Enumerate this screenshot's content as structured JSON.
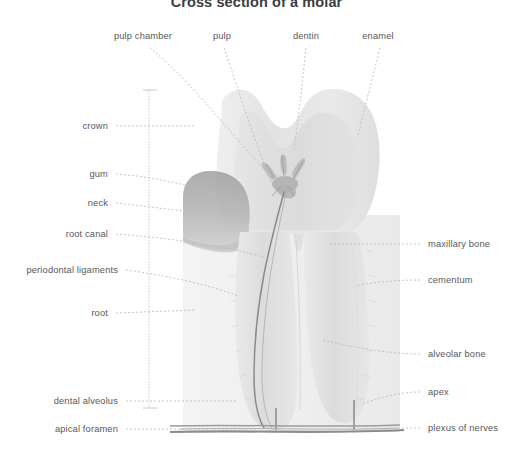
{
  "figure": {
    "title": "Cross section of a molar",
    "width": 513,
    "height": 462,
    "background_color": "#ffffff",
    "label_color": "#585858",
    "title_color": "#3d3d3d"
  },
  "colors": {
    "enamel": "#e6e6e6",
    "dentin": "#dcdcdc",
    "pulp": "#d2d2d2",
    "gum": "#a8a8a8",
    "bone": "#ececec",
    "canal_line": "#8e8e8e",
    "leader_line": "#b4b4b4",
    "bracket_line": "#c0c0c0",
    "nerve_band": "#9a9a9a"
  },
  "labels": {
    "top": [
      {
        "id": "pulp-chamber",
        "text": "pulp chamber",
        "x": 143,
        "y": 38,
        "align": "center"
      },
      {
        "id": "pulp",
        "text": "pulp",
        "x": 222,
        "y": 38,
        "align": "center"
      },
      {
        "id": "dentin",
        "text": "dentin",
        "x": 306,
        "y": 38,
        "align": "center"
      },
      {
        "id": "enamel",
        "text": "enamel",
        "x": 378,
        "y": 38,
        "align": "center"
      }
    ],
    "left": [
      {
        "id": "crown",
        "text": "crown",
        "x": 108,
        "y": 128,
        "align": "right"
      },
      {
        "id": "gum",
        "text": "gum",
        "x": 108,
        "y": 176,
        "align": "right"
      },
      {
        "id": "neck",
        "text": "neck",
        "x": 108,
        "y": 205,
        "align": "right"
      },
      {
        "id": "root-canal",
        "text": "root canal",
        "x": 108,
        "y": 236,
        "align": "right"
      },
      {
        "id": "periodontal-ligaments",
        "text": "periodontal ligaments",
        "x": 118,
        "y": 272,
        "align": "right"
      },
      {
        "id": "root",
        "text": "root",
        "x": 108,
        "y": 315,
        "align": "right"
      },
      {
        "id": "dental-alveolus",
        "text": "dental alveolus",
        "x": 118,
        "y": 403,
        "align": "right"
      },
      {
        "id": "apical-foramen",
        "text": "apical foramen",
        "x": 118,
        "y": 431,
        "align": "right"
      }
    ],
    "right": [
      {
        "id": "maxillary-bone",
        "text": "maxillary bone",
        "x": 428,
        "y": 246,
        "align": "left"
      },
      {
        "id": "cementum",
        "text": "cementum",
        "x": 428,
        "y": 282,
        "align": "left"
      },
      {
        "id": "alveolar-bone",
        "text": "alveolar bone",
        "x": 428,
        "y": 356,
        "align": "left"
      },
      {
        "id": "apex",
        "text": "apex",
        "x": 428,
        "y": 394,
        "align": "left"
      },
      {
        "id": "plexus-of-nerves",
        "text": "plexus of nerves",
        "x": 428,
        "y": 430,
        "align": "left"
      }
    ]
  }
}
